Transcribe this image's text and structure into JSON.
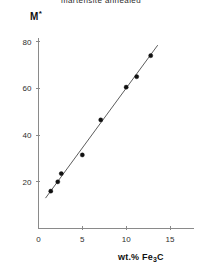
{
  "chart_data": {
    "type": "scatter",
    "title": "martensite annealed",
    "xlabel": "wt.% Fe3C",
    "ylabel": "M*",
    "xlim": [
      0,
      17.5
    ],
    "ylim": [
      0,
      87
    ],
    "grid": false,
    "legend": "none",
    "xticks": [
      0,
      5,
      10,
      15
    ],
    "xticklabels": [
      "0",
      "5",
      "10",
      "15"
    ],
    "yticks": [
      20,
      40,
      60,
      80
    ],
    "yticklabels": [
      "20",
      "40",
      "60",
      "80"
    ],
    "series": [
      {
        "name": "M* data",
        "marker": "filled-circle",
        "color": "#111111",
        "x": [
          1.4,
          2.2,
          2.6,
          5.0,
          7.1,
          10.0,
          11.2,
          12.8
        ],
        "y": [
          16.0,
          20.0,
          23.5,
          31.5,
          46.5,
          60.5,
          65.0,
          74.0
        ]
      }
    ],
    "fit_line": {
      "name": "linear fit",
      "color": "#4a4a4a",
      "x": [
        0.8,
        13.6
      ],
      "y": [
        13.0,
        78.5
      ]
    }
  },
  "axis_titles": {
    "y": "M",
    "y_superscript": "*",
    "x_prefix": "wt.% Fe",
    "x_subscript": "3",
    "x_suffix": "C"
  }
}
